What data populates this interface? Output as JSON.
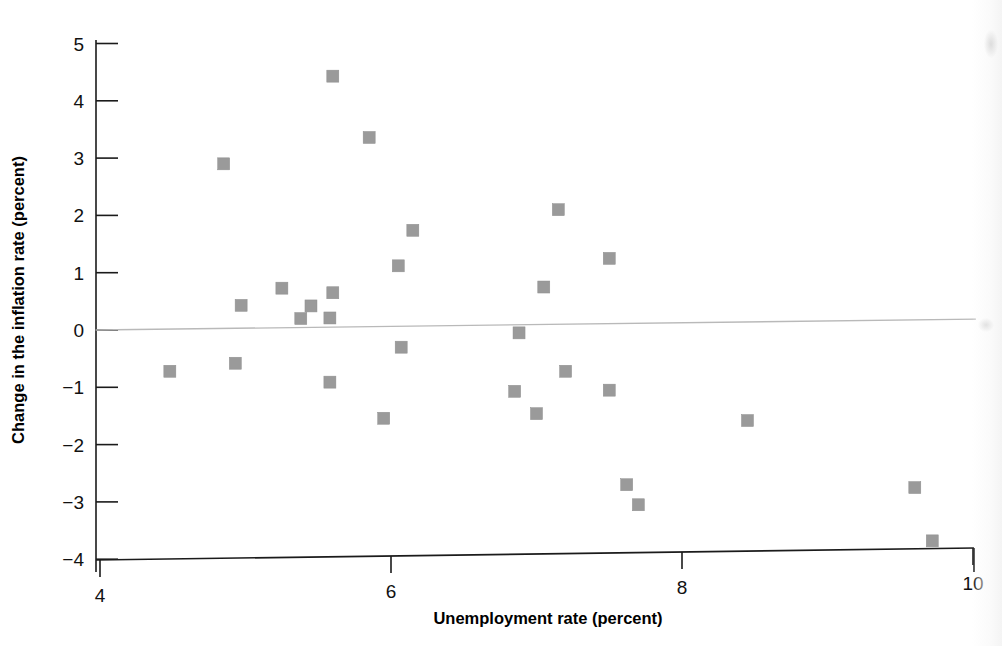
{
  "chart_data": {
    "type": "scatter",
    "title": "",
    "xlabel": "Unemployment rate (percent)",
    "ylabel": "Change in the inflation rate (percent)",
    "xlim": [
      4,
      10
    ],
    "ylim": [
      -4,
      5
    ],
    "xticks": [
      "4",
      "6",
      "8",
      "10"
    ],
    "xtick_values": [
      4,
      6,
      8,
      10
    ],
    "yticks": [
      "5",
      "4",
      "3",
      "2",
      "1",
      "0",
      "−1",
      "−2",
      "−3",
      "−4"
    ],
    "ytick_values": [
      5,
      4,
      3,
      2,
      1,
      0,
      -1,
      -2,
      -3,
      -4
    ],
    "grid": false,
    "legend": null,
    "marker": "square",
    "marker_color": "#9a9a9a",
    "marker_size_px": 12,
    "points": [
      {
        "x": 4.48,
        "y": -0.72
      },
      {
        "x": 4.85,
        "y": 2.9
      },
      {
        "x": 4.93,
        "y": -0.58
      },
      {
        "x": 4.97,
        "y": 0.43
      },
      {
        "x": 5.25,
        "y": 0.73
      },
      {
        "x": 5.38,
        "y": 0.2
      },
      {
        "x": 5.45,
        "y": 0.42
      },
      {
        "x": 5.58,
        "y": 0.21
      },
      {
        "x": 5.58,
        "y": -0.91
      },
      {
        "x": 5.6,
        "y": 0.65
      },
      {
        "x": 5.6,
        "y": 4.43
      },
      {
        "x": 5.85,
        "y": 3.36
      },
      {
        "x": 5.95,
        "y": -1.54
      },
      {
        "x": 6.05,
        "y": 1.12
      },
      {
        "x": 6.07,
        "y": -0.3
      },
      {
        "x": 6.15,
        "y": 1.74
      },
      {
        "x": 6.85,
        "y": -1.07
      },
      {
        "x": 6.88,
        "y": -0.05
      },
      {
        "x": 7.0,
        "y": -1.46
      },
      {
        "x": 7.05,
        "y": 0.75
      },
      {
        "x": 7.15,
        "y": 2.1
      },
      {
        "x": 7.2,
        "y": -0.72
      },
      {
        "x": 7.5,
        "y": 1.25
      },
      {
        "x": 7.5,
        "y": -1.05
      },
      {
        "x": 7.62,
        "y": -2.7
      },
      {
        "x": 7.7,
        "y": -3.05
      },
      {
        "x": 8.45,
        "y": -1.58
      },
      {
        "x": 9.6,
        "y": -2.75
      },
      {
        "x": 9.72,
        "y": -3.68
      }
    ],
    "trendline": {
      "label": "",
      "color": "#b9b9b9",
      "x_start": 3.97,
      "y_start": 0.0,
      "x_end": 10.02,
      "y_end": 0.19
    }
  },
  "axes": {
    "x_title": "Unemployment rate (percent)",
    "y_title": "Change in the inflation rate (percent)"
  }
}
